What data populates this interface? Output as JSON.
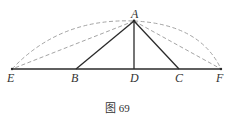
{
  "figure": {
    "caption": "图 69",
    "colors": {
      "solid_line": "#2a2a2a",
      "dashed_line": "#9a9a9a",
      "label": "#333333"
    },
    "points": {
      "A": {
        "label": "A",
        "x": 134,
        "y": 21
      },
      "E": {
        "label": "E",
        "x": 12,
        "y": 69
      },
      "B": {
        "label": "B",
        "x": 76,
        "y": 69
      },
      "D": {
        "label": "D",
        "x": 134,
        "y": 69
      },
      "C": {
        "label": "C",
        "x": 179,
        "y": 69
      },
      "F": {
        "label": "F",
        "x": 221,
        "y": 69
      }
    },
    "solid_segments": [
      "EF",
      "AB",
      "AD",
      "AC"
    ],
    "dashed_segments": [
      "AE",
      "AF"
    ],
    "dashed_arcs": [
      "E-A",
      "A-F"
    ]
  }
}
